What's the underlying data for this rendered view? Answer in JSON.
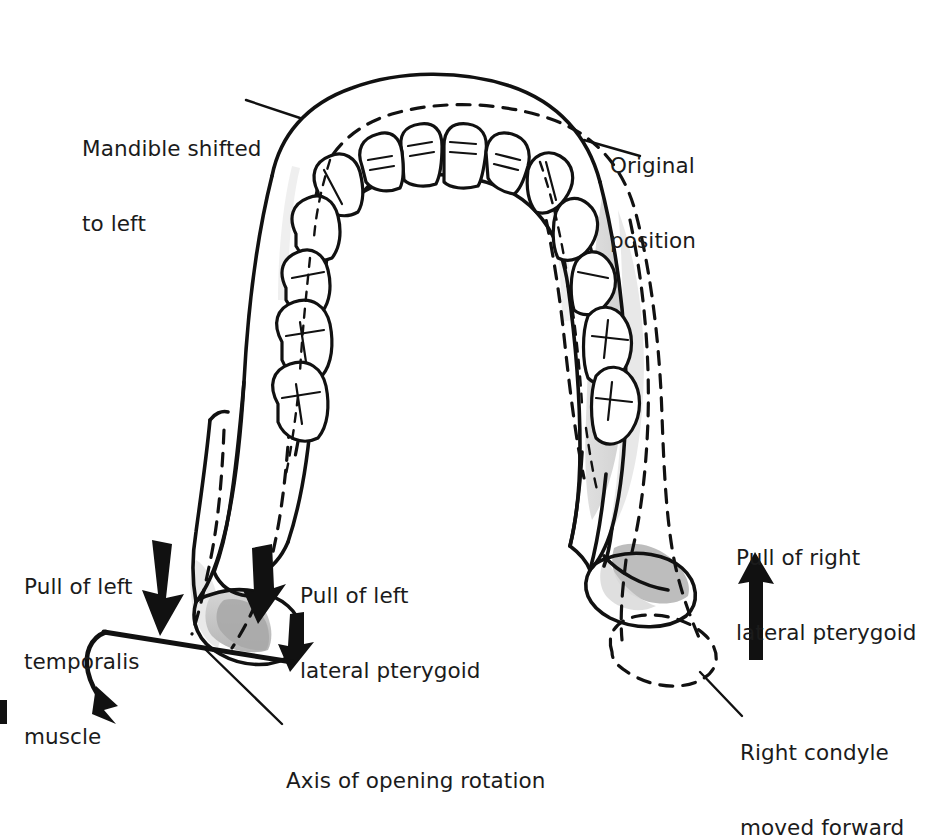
{
  "figure": {
    "view": "superior (occlusal) view of mandible",
    "background_color": "#ffffff",
    "ink_color": "#111111",
    "shade_light": "#e2e2e2",
    "shade_mid": "#c9c9c9",
    "shade_dark": "#a8a8a8"
  },
  "labels": {
    "mandible_shifted": {
      "line1": "Mandible shifted",
      "line2": "to left"
    },
    "original_position": {
      "line1": "Original",
      "line2": "position"
    },
    "pull_left_temporalis": {
      "line1": "Pull of left",
      "line2": "temporalis",
      "line3": "muscle"
    },
    "pull_left_lateral_pterygoid": {
      "line1": "Pull of left",
      "line2": "lateral pterygoid"
    },
    "pull_right_lateral_pterygoid": {
      "line1": "Pull of right",
      "line2": "lateral pterygoid"
    },
    "right_condyle_moved_forward": {
      "line1": "Right condyle",
      "line2": "moved forward"
    },
    "axis_of_opening_rotation": {
      "line1": "Axis of opening rotation"
    }
  },
  "annotations": {
    "solid_outline_meaning": "Mandible shifted to left",
    "dashed_outline_meaning": "Original position",
    "arrow_left_down": "Pull of left temporalis muscle",
    "arrow_left_up": "Pull of left lateral pterygoid",
    "arrow_right_up": "Pull of right lateral pterygoid",
    "curved_arrow": "Axis of opening rotation",
    "axis_line": "Axis of opening rotation through left condyle"
  },
  "teeth": {
    "arch": "mandibular",
    "count": 16,
    "groups": [
      "incisors",
      "canines",
      "premolars",
      "molars"
    ]
  }
}
